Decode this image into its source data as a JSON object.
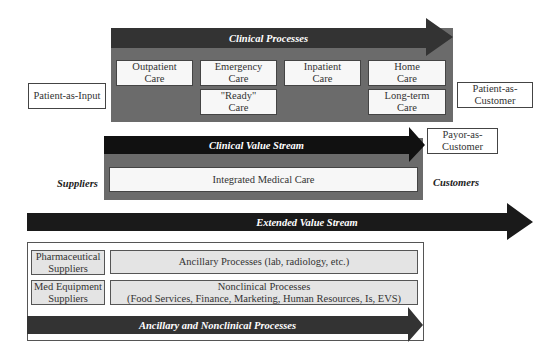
{
  "diagram": {
    "clinical_processes": {
      "arrow_label": "Clinical Processes",
      "boxes_row1": [
        "Outpatient\nCare",
        "Emergency\nCare",
        "Inpatient\nCare",
        "Home\nCare"
      ],
      "boxes_row2": [
        "\"Ready\"\nCare",
        "Long-term\nCare"
      ]
    },
    "clinical_value_stream": {
      "arrow_label": "Clinical Value Stream",
      "box": "Integrated Medical Care"
    },
    "extended_value_stream": {
      "arrow_label": "Extended Value Stream"
    },
    "ancillary": {
      "arrow_label": "Ancillary and Nonclinical Processes",
      "suppliers": [
        "Pharmaceutical\nSuppliers",
        "Med Equipment\nSuppliers"
      ],
      "processes": [
        "Ancillary Processes (lab, radiology, etc.)",
        "Nonclinical Processes\n(Food Services, Finance, Marketing, Human Resources, Is, EVS)"
      ]
    },
    "left": {
      "patient_input": "Patient-as-Input",
      "suppliers_label": "Suppliers"
    },
    "right": {
      "patient_customer": "Patient-as-\nCustomer",
      "payor_customer": "Payor-as-\nCustomer",
      "customers_label": "Customers"
    },
    "colors": {
      "panel_gray": "#6b6b6b",
      "arrow_dark": "#2e2e2e",
      "arrow_black": "#111111",
      "box_light": "#f7f7f7",
      "box_gray": "#e4e4e4"
    }
  }
}
